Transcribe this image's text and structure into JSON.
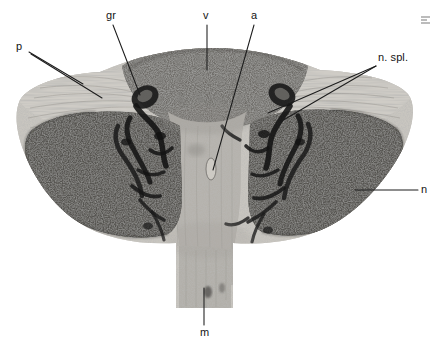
{
  "figure": {
    "type": "histological-section-plate",
    "background_color": "#ffffff",
    "width": 442,
    "height": 349,
    "corner_mark": "scan-artifact-mark"
  },
  "palette": {
    "background": "#ffffff",
    "ink": "#141414",
    "lobe_dark": "#595754",
    "lobe_darkest": "#3b3a38",
    "central_mid": "#9b9893",
    "central_light": "#bbb8b2",
    "capsule_light": "#cdcac4",
    "crescent_dark": "#6d6b67",
    "vessel_black": "#1a1a1a",
    "leader_line": "#1c1c1c"
  },
  "labels": [
    {
      "id": "p",
      "text": "p",
      "x": 16,
      "y": 41,
      "anchor_x": 29,
      "anchor_y": 52,
      "tip_x": 83,
      "tip_y": 84,
      "align": "left"
    },
    {
      "id": "gr",
      "text": "gr",
      "x": 106,
      "y": 10,
      "anchor_x": 113,
      "anchor_y": 25,
      "tip_x": 140,
      "tip_y": 95,
      "align": "left"
    },
    {
      "id": "v",
      "text": "v",
      "x": 203,
      "y": 10,
      "anchor_x": 207,
      "anchor_y": 25,
      "tip_x": 207,
      "tip_y": 70,
      "align": "left"
    },
    {
      "id": "a",
      "text": "a",
      "x": 251,
      "y": 10,
      "anchor_x": 254,
      "anchor_y": 25,
      "tip_x": 213,
      "tip_y": 170,
      "align": "left"
    },
    {
      "id": "n_spl",
      "text": "n. spl.",
      "x": 378,
      "y": 52,
      "anchor_x": 376,
      "anchor_y": 65,
      "tip_x": 268,
      "tip_y": 113,
      "align": "left"
    },
    {
      "id": "n",
      "text": "n",
      "x": 421,
      "y": 184,
      "anchor_x": 418,
      "anchor_y": 190,
      "tip_x": 355,
      "tip_y": 190,
      "align": "left"
    },
    {
      "id": "m",
      "text": "m",
      "x": 200,
      "y": 327,
      "anchor_x": 204,
      "anchor_y": 325,
      "tip_x": 204,
      "tip_y": 288,
      "align": "left"
    }
  ],
  "label_meanings": {
    "p": "p",
    "gr": "gr",
    "v": "v",
    "a": "a",
    "n_spl": "n. spl.",
    "n": "n",
    "m": "m"
  },
  "regions": [
    {
      "name": "left-lobe",
      "tone": "dark",
      "label_ref": "n"
    },
    {
      "name": "right-lobe",
      "tone": "dark",
      "label_ref": "n"
    },
    {
      "name": "upper-crescent",
      "tone": "medium",
      "label_ref": "v"
    },
    {
      "name": "central-column",
      "tone": "light",
      "label_ref": "a"
    },
    {
      "name": "left-capsule-fan",
      "tone": "light",
      "label_ref": "p"
    },
    {
      "name": "right-capsule-fan",
      "tone": "light",
      "label_ref": "n. spl."
    },
    {
      "name": "left-hilar-vessels",
      "tone": "black",
      "label_ref": "gr"
    },
    {
      "name": "right-hilar-vessels",
      "tone": "black",
      "label_ref": "n. spl."
    },
    {
      "name": "inferior-stalk",
      "tone": "light",
      "label_ref": "m"
    }
  ]
}
